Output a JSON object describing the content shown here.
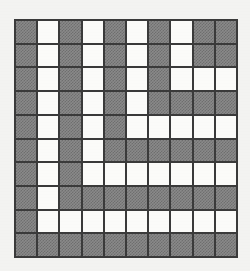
{
  "figure": {
    "kind": "grid-puzzle",
    "title": "",
    "rows": 10,
    "columns": 10,
    "legend": {
      "filled_label": "filled",
      "empty_label": "empty"
    },
    "colors": {
      "background": "#f3f3f1",
      "grid_line": "#3a3a3a",
      "filled_cell": "#8a8a8a",
      "filled_cell_dither": "#6f6f6f",
      "empty_cell": "#fbfbf9"
    }
  },
  "chart_data": {
    "type": "heatmap",
    "title": "",
    "xlabel": "",
    "ylabel": "",
    "grid": true,
    "legend_position": "none",
    "categories_x": [
      "1",
      "2",
      "3",
      "4",
      "5",
      "6",
      "7",
      "8",
      "9",
      "10"
    ],
    "categories_y": [
      "1",
      "2",
      "3",
      "4",
      "5",
      "6",
      "7",
      "8",
      "9",
      "10"
    ],
    "value_map": {
      "1": "filled",
      "0": "empty"
    },
    "values": [
      [
        1,
        0,
        1,
        0,
        1,
        0,
        1,
        0,
        1,
        1
      ],
      [
        1,
        0,
        1,
        0,
        1,
        0,
        1,
        0,
        1,
        1
      ],
      [
        1,
        0,
        1,
        0,
        1,
        0,
        1,
        0,
        0,
        0
      ],
      [
        1,
        0,
        1,
        0,
        1,
        0,
        1,
        1,
        1,
        1
      ],
      [
        1,
        0,
        1,
        0,
        1,
        0,
        0,
        0,
        0,
        0
      ],
      [
        1,
        0,
        1,
        0,
        1,
        1,
        1,
        1,
        1,
        1
      ],
      [
        1,
        0,
        1,
        0,
        0,
        0,
        0,
        0,
        0,
        0
      ],
      [
        1,
        0,
        1,
        1,
        1,
        1,
        1,
        1,
        1,
        1
      ],
      [
        1,
        0,
        0,
        0,
        0,
        0,
        0,
        0,
        0,
        0
      ],
      [
        1,
        1,
        1,
        1,
        1,
        1,
        1,
        1,
        1,
        1
      ]
    ]
  }
}
